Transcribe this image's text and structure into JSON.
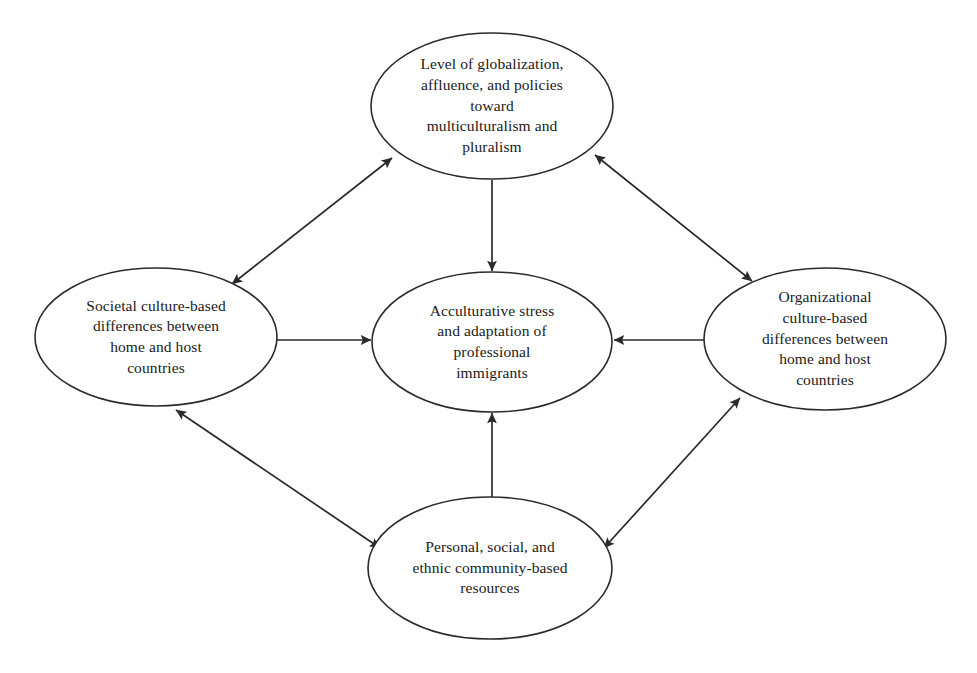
{
  "diagram": {
    "type": "concept-model",
    "background_color": "#ffffff",
    "stroke_color": "#2a2a2a",
    "text_color": "#1a1a1a",
    "nodes": [
      {
        "id": "globalization",
        "name": "node-globalization",
        "text": "Level of globalization, affluence, and policies toward multiculturalism and pluralism",
        "lines": [
          "Level of globalization,",
          "affluence, and policies",
          "toward",
          "multiculturalism and",
          "pluralism"
        ],
        "cx": 492,
        "cy": 106,
        "rx": 121,
        "ry": 73
      },
      {
        "id": "societal-culture",
        "name": "node-societal-culture",
        "text": "Societal culture-based differences between home and host countries",
        "lines": [
          "Societal culture-based",
          "differences between",
          "home and host",
          "countries"
        ],
        "cx": 156,
        "cy": 337,
        "rx": 121,
        "ry": 69
      },
      {
        "id": "acculturative-stress",
        "name": "node-acculturative-stress",
        "text": "Acculturative stress and adaptation of professional immigrants",
        "lines": [
          "Acculturative stress",
          "and adaptation of",
          "professional",
          "immigrants"
        ],
        "cx": 492,
        "cy": 342,
        "rx": 120,
        "ry": 70
      },
      {
        "id": "organizational-culture",
        "name": "node-organizational-culture",
        "text": "Organizational culture-based differences between home and host countries",
        "lines": [
          "Organizational",
          "culture-based",
          "differences between",
          "home and host",
          "countries"
        ],
        "cx": 825,
        "cy": 339,
        "rx": 121,
        "ry": 71
      },
      {
        "id": "personal-resources",
        "name": "node-personal-resources",
        "text": "Personal, social, and ethnic community-based resources",
        "lines": [
          "Personal, social, and",
          "ethnic community-based",
          "resources"
        ],
        "cx": 490,
        "cy": 568,
        "rx": 122,
        "ry": 71
      }
    ],
    "edges": [
      {
        "id": "edge-globalization-societal",
        "name": "edge-globalization-societal",
        "from": "globalization",
        "to": "societal-culture",
        "arrowheads": "both",
        "x1": 392,
        "y1": 158,
        "x2": 232,
        "y2": 284
      },
      {
        "id": "edge-globalization-organizational",
        "name": "edge-globalization-organizational",
        "from": "globalization",
        "to": "organizational-culture",
        "arrowheads": "both",
        "x1": 595,
        "y1": 155,
        "x2": 752,
        "y2": 281
      },
      {
        "id": "edge-societal-personal",
        "name": "edge-societal-personal",
        "from": "societal-culture",
        "to": "personal-resources",
        "arrowheads": "both",
        "x1": 176,
        "y1": 410,
        "x2": 380,
        "y2": 548
      },
      {
        "id": "edge-personal-organizational",
        "name": "edge-personal-organizational",
        "from": "personal-resources",
        "to": "organizational-culture",
        "arrowheads": "both",
        "x1": 604,
        "y1": 548,
        "x2": 740,
        "y2": 398
      },
      {
        "id": "edge-globalization-stress",
        "name": "edge-globalization-stress",
        "from": "globalization",
        "to": "acculturative-stress",
        "arrowheads": "end",
        "x1": 492,
        "y1": 180,
        "x2": 492,
        "y2": 271
      },
      {
        "id": "edge-societal-stress",
        "name": "edge-societal-stress",
        "from": "societal-culture",
        "to": "acculturative-stress",
        "arrowheads": "end",
        "x1": 277,
        "y1": 340,
        "x2": 371,
        "y2": 340
      },
      {
        "id": "edge-organizational-stress",
        "name": "edge-organizational-stress",
        "from": "organizational-culture",
        "to": "acculturative-stress",
        "arrowheads": "end",
        "x1": 705,
        "y1": 340,
        "x2": 614,
        "y2": 340
      },
      {
        "id": "edge-personal-stress",
        "name": "edge-personal-stress",
        "from": "personal-resources",
        "to": "acculturative-stress",
        "arrowheads": "end",
        "x1": 492,
        "y1": 497,
        "x2": 492,
        "y2": 413
      }
    ]
  }
}
